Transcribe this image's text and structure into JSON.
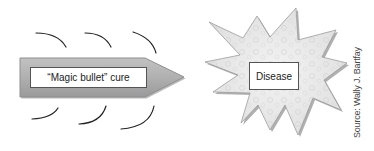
{
  "diagram": {
    "bullet": {
      "label": "“Magic bullet” cure",
      "fill_color": "#b3b3b3",
      "edge_color": "#8a8a8a"
    },
    "target": {
      "label": "Disease",
      "fill_color": "#eeeeee",
      "edge_color": "#888888"
    },
    "motion_lines": {
      "count_above": 3,
      "count_below": 3,
      "color": "#222222"
    },
    "source_credit": "Source: Wally J. Bartfay"
  }
}
